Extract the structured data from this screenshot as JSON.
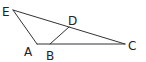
{
  "diagram": {
    "type": "geometry-figure",
    "points": [
      {
        "id": "E",
        "label": "E",
        "x": 13,
        "y": 10,
        "lx": 2,
        "ly": 16
      },
      {
        "id": "A",
        "label": "A",
        "x": 37,
        "y": 44,
        "lx": 24,
        "ly": 56
      },
      {
        "id": "B",
        "label": "B",
        "x": 50,
        "y": 44,
        "lx": 46,
        "ly": 60
      },
      {
        "id": "D",
        "label": "D",
        "x": 69,
        "y": 27,
        "lx": 68,
        "ly": 25
      },
      {
        "id": "C",
        "label": "C",
        "x": 125,
        "y": 44,
        "lx": 128,
        "ly": 50
      }
    ],
    "segments": [
      {
        "from": "E",
        "to": "A"
      },
      {
        "from": "E",
        "to": "C"
      },
      {
        "from": "A",
        "to": "C"
      },
      {
        "from": "B",
        "to": "D"
      }
    ],
    "colors": {
      "stroke": "#333333",
      "label": "#222222",
      "background": "#ffffff"
    }
  }
}
